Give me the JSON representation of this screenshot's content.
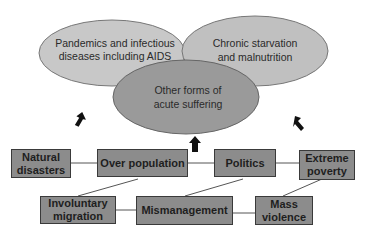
{
  "ellipses": {
    "left": {
      "line1": "Pandemics and infectious",
      "line2": "diseases including AIDS"
    },
    "right": {
      "line1": "Chronic starvation",
      "line2": "and malnutrition"
    },
    "center": {
      "line1": "Other forms of",
      "line2": "acute suffering"
    }
  },
  "boxes": {
    "natural_disasters": {
      "line1": "Natural",
      "line2": "disasters"
    },
    "over_population": {
      "line1": "Over population"
    },
    "politics": {
      "line1": "Politics"
    },
    "extreme_poverty": {
      "line1": "Extreme",
      "line2": "poverty"
    },
    "involuntary_migration": {
      "line1": "Involuntary",
      "line2": "migration"
    },
    "mismanagement": {
      "line1": "Mismanagement"
    },
    "mass_violence": {
      "line1": "Mass",
      "line2": "violence"
    }
  },
  "colors": {
    "ellipse_light": "#c8c8c8",
    "ellipse_dark": "#9a9a9a",
    "box_fill": "#8c8c8c",
    "arrow": "#111111"
  }
}
